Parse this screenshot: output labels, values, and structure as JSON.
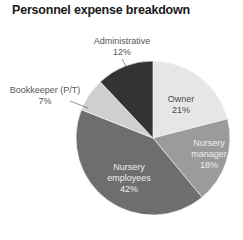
{
  "chart_data": {
    "type": "pie",
    "title": "Personnel expense breakdown",
    "categories": [
      "Owner",
      "Nursery manager",
      "Nursery employees",
      "Bookkeeper (P/T)",
      "Administrative"
    ],
    "values": [
      21,
      18,
      42,
      7,
      12
    ],
    "unit": "%",
    "start_angle": "12 o'clock",
    "direction": "clockwise",
    "colors": [
      "#e6e6e6",
      "#9b9b9b",
      "#6e6e6e",
      "#cfcfcf",
      "#333333"
    ],
    "labels": [
      {
        "name": "Owner",
        "value": "21%",
        "placement": "inside"
      },
      {
        "name": "Nursery manager",
        "value": "18%",
        "placement": "inside"
      },
      {
        "name": "Nursery employees",
        "value": "42%",
        "placement": "inside"
      },
      {
        "name": "Bookkeeper (P/T)",
        "value": "7%",
        "placement": "outside"
      },
      {
        "name": "Administrative",
        "value": "12%",
        "placement": "outside"
      }
    ],
    "legend": "none",
    "grid": false
  },
  "labels": {
    "owner": {
      "line1": "Owner",
      "line2": "21%"
    },
    "manager": {
      "line1": "Nursery",
      "line2": "manager",
      "line3": "18%"
    },
    "employees": {
      "line1": "Nursery",
      "line2": "employees",
      "line3": "42%"
    },
    "bookkeeper": {
      "line1": "Bookkeeper (P/T)",
      "line2": "7%"
    },
    "administrative": {
      "line1": "Administrative",
      "line2": "12%"
    }
  }
}
